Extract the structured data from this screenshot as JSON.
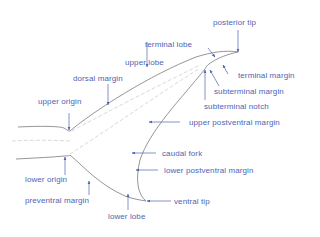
{
  "diagram": {
    "colors": {
      "label": "#4d64b4",
      "arrow": "#4d64b4",
      "outline": "#7a7a7a",
      "inner": "#c8c8c8",
      "background": "#ffffff"
    },
    "labels": {
      "posterior_tip": "posterior tip",
      "terminal_lobe": "terminal lobe",
      "upper_lobe": "upper lobe",
      "dorsal_margin": "dorsal margin",
      "terminal_margin": "terminal margin",
      "subterminal_margin": "subterminal margin",
      "subterminal_notch": "subterminal notch",
      "upper_origin": "upper origin",
      "upper_postventral_margin": "upper postventral margin",
      "caudal_fork": "caudal fork",
      "lower_postventral_margin": "lower postventral margin",
      "lower_origin": "lower origin",
      "preventral_margin": "preventral margin",
      "ventral_tip": "ventral tip",
      "lower_lobe": "lower lobe"
    }
  }
}
